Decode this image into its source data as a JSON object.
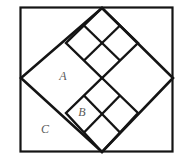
{
  "figure": {
    "background_color": "#ffffff",
    "stroke_color": "#141414",
    "label_color": "#5a5a5a",
    "frame": {
      "name": "outer-square-frame",
      "x": 20.5,
      "y": 7.5,
      "width": 152,
      "height": 144,
      "stroke_width": 2.2
    },
    "diamond": {
      "name": "large-inscribed-diamond",
      "points": "102,8 173,78 102,152 21,78",
      "stroke_width": 2.6
    },
    "upper_cluster": {
      "name": "upper-square-cluster",
      "description": "2x2 grid of small squares rotated 45 degrees, top vertex at diamond apex",
      "outline": "102,8 138,43 102,78 66,43",
      "divider_a": "84,25.5 120,60.5",
      "divider_b": "84,60.5 120,25.5",
      "stroke_width": 2.4
    },
    "lower_cluster": {
      "name": "lower-square-cluster",
      "description": "2x2 grid of small squares rotated 45 degrees, bottom vertex at diamond base",
      "outline": "102,78 138,113 102,152 66,113",
      "divider_a": "84,95.5 120,132.5",
      "divider_b": "84,132.5 120,95.5",
      "stroke_width": 2.4
    },
    "labels": [
      {
        "id": "label-a",
        "text": "A",
        "x": 63,
        "y": 77,
        "font_size": 12
      },
      {
        "id": "label-b",
        "text": "B",
        "x": 82,
        "y": 113,
        "font_size": 12
      },
      {
        "id": "label-c",
        "text": "C",
        "x": 45,
        "y": 130,
        "font_size": 12
      }
    ]
  }
}
